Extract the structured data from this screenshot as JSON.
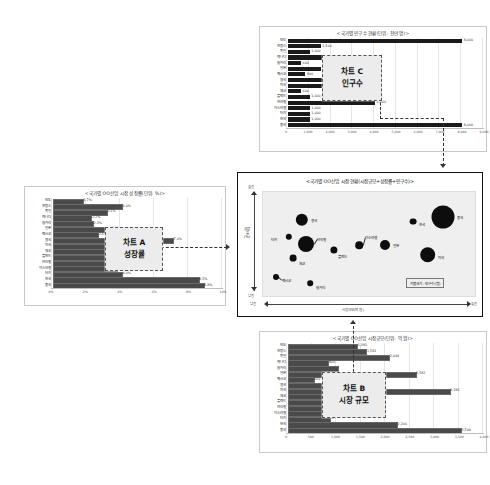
{
  "chart_data": [
    {
      "id": "chart_a",
      "type": "bar",
      "orientation": "horizontal",
      "title": "<국가별 OO산업 시장 성장률(단위: %)>",
      "xlabel": "",
      "ylabel": "",
      "xlim": [
        0,
        10
      ],
      "grid": true,
      "ticks": [
        "0%",
        "2%",
        "4%",
        "6%",
        "8%",
        "10%"
      ],
      "categories": [
        "인도",
        "프랑스",
        "독일",
        "캐나다",
        "헝가리",
        "일본",
        "멕시코",
        "영국",
        "미국",
        "체코",
        "폴란드",
        "브라질",
        "이스라엘",
        "터키",
        "한국",
        "중국"
      ],
      "values": [
        1.7,
        4.0,
        3.1,
        2.2,
        2.3,
        3.4,
        2.6,
        7.0,
        3.3,
        3.1,
        3.5,
        3.6,
        3.7,
        4.0,
        8.5,
        8.8
      ],
      "value_labels": [
        "1.7%",
        "4.0%",
        "3.1%",
        "2.2%",
        "2.3%",
        "3.4%",
        "2.6%",
        "7.0%",
        "3.3%",
        "3.1%",
        "3.5%",
        "3.6%",
        "3.7%",
        "4.0%",
        "8.5%",
        "8.8%"
      ],
      "callout": {
        "line1": "차트 A",
        "line2": "성장률"
      }
    },
    {
      "id": "chart_b",
      "type": "bar",
      "orientation": "horizontal",
      "title": "<국가별 OO산업 시장규모(단위: 억 원)>",
      "xlabel": "",
      "ylabel": "",
      "xlim": [
        0,
        4000
      ],
      "grid": true,
      "ticks": [
        "0",
        "500",
        "1,000",
        "1,500",
        "2,000",
        "2,500",
        "3,000",
        "3,500",
        "4,000"
      ],
      "categories": [
        "인도",
        "프랑스",
        "독일",
        "캐나다",
        "헝가리",
        "일본",
        "멕시코",
        "영국",
        "미국",
        "체코",
        "폴란드",
        "브라질",
        "이스라엘",
        "터키",
        "한국",
        "중국"
      ],
      "values": [
        1391,
        1581,
        2044,
        800,
        1000,
        2582,
        500,
        1100,
        3281,
        700,
        1000,
        1000,
        1000,
        827,
        2206,
        3509
      ],
      "value_labels": [
        "1,391",
        "1,581",
        "2,044",
        "800",
        "",
        "2,582",
        "500",
        "",
        "3,281",
        "",
        "",
        "",
        "",
        "827",
        "2,206",
        "3,509"
      ],
      "callout": {
        "line1": "차트 B",
        "line2": "시장 규모"
      }
    },
    {
      "id": "chart_c",
      "type": "bar",
      "orientation": "horizontal",
      "title": "<국가별 인구수 현황(단위: 천만 명)>",
      "xlabel": "",
      "ylabel": "",
      "xlim": [
        0,
        9000
      ],
      "grid": true,
      "ticks": [
        "0",
        "1,000",
        "2,000",
        "3,000",
        "4,000",
        "5,000",
        "6,000",
        "7,000",
        "8,000",
        "9,000"
      ],
      "categories": [
        "인도",
        "프랑스",
        "독일",
        "캐나다",
        "헝가리",
        "일본",
        "멕시코",
        "영국",
        "미국",
        "체코",
        "폴란드",
        "브라질",
        "이스라엘",
        "터키",
        "한국",
        "중국"
      ],
      "values": [
        8000,
        1500,
        1000,
        1800,
        600,
        1500,
        800,
        3000,
        2500,
        600,
        1000,
        4000,
        1000,
        1000,
        1000,
        8000
      ],
      "value_labels": [
        "8,000",
        "1,500",
        "1,000",
        "1,800",
        "600",
        "1,500",
        "800",
        "3,000",
        "",
        "600",
        "1,000",
        "4,000",
        "1,000",
        "1,000",
        "1,000",
        "8,000"
      ],
      "callout": {
        "line1": "차트 C",
        "line2": "인구수"
      }
    },
    {
      "id": "bubble_chart",
      "type": "scatter",
      "title": "<국가별 OO산업 시장 현황(시장규모+성장률+인구수)>",
      "xlabel": "시장규모(억 원)",
      "ylabel": "성장률(%)",
      "x_low_label": "낮음",
      "x_high_label": "높음",
      "y_low_label": "낮음",
      "y_high_label": "높음",
      "legend": "거품크기 : 인구수(명)",
      "size_meaning": "인구수(명)",
      "points": [
        {
          "name": "영국",
          "x": 18,
          "y": 74,
          "r": 6.2,
          "label_dx": 9,
          "label_dy": 0,
          "leader": false
        },
        {
          "name": "터키",
          "x": 12,
          "y": 58,
          "r": 3.2,
          "label_dx": -12,
          "label_dy": 2,
          "leader": false
        },
        {
          "name": "브라질",
          "x": 20,
          "y": 51,
          "r": 8.0,
          "label_dx": 11,
          "label_dy": -5,
          "leader": true
        },
        {
          "name": "체코",
          "x": 14,
          "y": 38,
          "r": 3.4,
          "label_dx": 6,
          "label_dy": 5,
          "leader": false
        },
        {
          "name": "멕시코",
          "x": 6,
          "y": 20,
          "r": 3.0,
          "label_dx": 6,
          "label_dy": 3,
          "leader": true
        },
        {
          "name": "헝가리",
          "x": 22,
          "y": 14,
          "r": 2.8,
          "label_dx": 6,
          "label_dy": 4,
          "leader": false
        },
        {
          "name": "폴란드",
          "x": 33,
          "y": 45,
          "r": 3.6,
          "label_dx": 4,
          "label_dy": 6,
          "leader": false
        },
        {
          "name": "이스라엘",
          "x": 45,
          "y": 50,
          "r": 3.8,
          "label_dx": 6,
          "label_dy": -8,
          "leader": true
        },
        {
          "name": "일본",
          "x": 57,
          "y": 50,
          "r": 5.0,
          "label_dx": 8,
          "label_dy": 0,
          "leader": false
        },
        {
          "name": "한국",
          "x": 70,
          "y": 72,
          "r": 3.4,
          "label_dx": 6,
          "label_dy": 2,
          "leader": false
        },
        {
          "name": "중국",
          "x": 84,
          "y": 76,
          "r": 11.5,
          "label_dx": 14,
          "label_dy": 0,
          "leader": false
        },
        {
          "name": "미국",
          "x": 77,
          "y": 41,
          "r": 7.8,
          "label_dx": 10,
          "label_dy": 2,
          "leader": false
        }
      ]
    }
  ]
}
